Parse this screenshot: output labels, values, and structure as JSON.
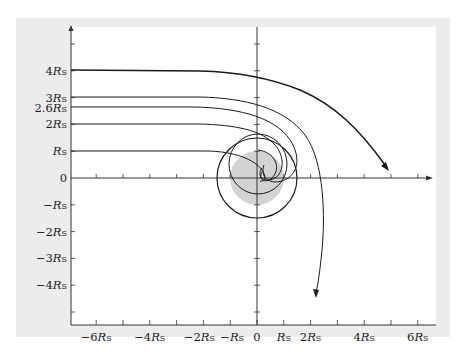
{
  "figure": {
    "panel_color": "#ececec",
    "plot_bg": "#ffffff",
    "line_color": "#1a1a1a",
    "horizon_fill": "#d3d3d3"
  },
  "axes": {
    "x_ticks": [
      {
        "value": -6,
        "label": "−6",
        "unit": "R",
        "sub": "S"
      },
      {
        "value": -4,
        "label": "−4",
        "unit": "R",
        "sub": "S"
      },
      {
        "value": -2,
        "label": "−2",
        "unit": "R",
        "sub": "S"
      },
      {
        "value": -1,
        "label": "−",
        "unit": "R",
        "sub": "S"
      },
      {
        "value": 0,
        "label": "0",
        "unit": "",
        "sub": ""
      },
      {
        "value": 1,
        "label": "",
        "unit": "R",
        "sub": "S"
      },
      {
        "value": 2,
        "label": "2",
        "unit": "R",
        "sub": "S"
      },
      {
        "value": 4,
        "label": "4",
        "unit": "R",
        "sub": "S"
      },
      {
        "value": 6,
        "label": "6",
        "unit": "R",
        "sub": "S"
      }
    ],
    "y_ticks": [
      {
        "value": 4,
        "label": "4",
        "unit": "R",
        "sub": "S"
      },
      {
        "value": 3,
        "label": "3",
        "unit": "R",
        "sub": "S"
      },
      {
        "value": 2.6,
        "label": "2.6",
        "unit": "R",
        "sub": "S"
      },
      {
        "value": 2,
        "label": "2",
        "unit": "R",
        "sub": "S"
      },
      {
        "value": 1,
        "label": "",
        "unit": "R",
        "sub": "S"
      },
      {
        "value": 0,
        "label": "0",
        "unit": "",
        "sub": ""
      },
      {
        "value": -1,
        "label": "−",
        "unit": "R",
        "sub": "S"
      },
      {
        "value": -2,
        "label": "−2",
        "unit": "R",
        "sub": "S"
      },
      {
        "value": -3,
        "label": "−3",
        "unit": "R",
        "sub": "S"
      },
      {
        "value": -4,
        "label": "−4",
        "unit": "R",
        "sub": "S"
      }
    ]
  },
  "diagram": {
    "event_horizon_radius": 1,
    "photon_sphere_radius": 1.5,
    "rays": [
      {
        "impact_parameter": 4,
        "outcome": "deflected, escapes"
      },
      {
        "impact_parameter": 3,
        "outcome": "strongly deflected, escapes downward"
      },
      {
        "impact_parameter": 2.6,
        "outcome": "captured after spiral"
      },
      {
        "impact_parameter": 2,
        "outcome": "captured"
      },
      {
        "impact_parameter": 1,
        "outcome": "captured"
      }
    ]
  }
}
